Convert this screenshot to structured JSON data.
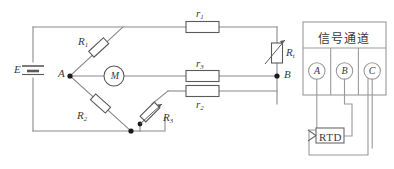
{
  "figure": {
    "type": "circuit-diagram"
  },
  "colors": {
    "wire": "#8a8a8a",
    "component_stroke": "#5a5a5a",
    "label_text": "#3a3a3a",
    "panel_stroke": "#9a9a9a",
    "background": "#ffffff",
    "node_fill": "#1a1a1a"
  },
  "bridge": {
    "source": {
      "label": "E",
      "name": "battery"
    },
    "nodes": [
      {
        "label": "A",
        "name": "node-a"
      },
      {
        "label": "B",
        "name": "node-b"
      }
    ],
    "meter": {
      "label": "M",
      "name": "galvanometer"
    },
    "resistors": [
      {
        "label": "R",
        "sub": "1",
        "name": "resistor-r1",
        "orientation": "diagonal"
      },
      {
        "label": "R",
        "sub": "2",
        "name": "resistor-r2",
        "orientation": "diagonal"
      },
      {
        "label": "R",
        "sub": "3",
        "name": "rheostat-r3",
        "orientation": "diagonal",
        "variable": true
      }
    ],
    "lead_resistances": [
      {
        "label": "r",
        "sub": "1",
        "name": "lead-resistance-r1",
        "orientation": "horizontal"
      },
      {
        "label": "r",
        "sub": "3",
        "name": "lead-resistance-r3",
        "orientation": "horizontal"
      },
      {
        "label": "r",
        "sub": "2",
        "name": "lead-resistance-r2",
        "orientation": "horizontal"
      }
    ],
    "sensor": {
      "label": "R",
      "sub": "t",
      "name": "rtd-sensing-element",
      "orientation": "vertical",
      "variable": true
    }
  },
  "panel": {
    "title": "信号通道",
    "terminals": [
      {
        "label": "A",
        "name": "terminal-a"
      },
      {
        "label": "B",
        "name": "terminal-b"
      },
      {
        "label": "C",
        "name": "terminal-c"
      }
    ],
    "sensor_box": {
      "label": "RTD",
      "name": "rtd-box"
    }
  }
}
